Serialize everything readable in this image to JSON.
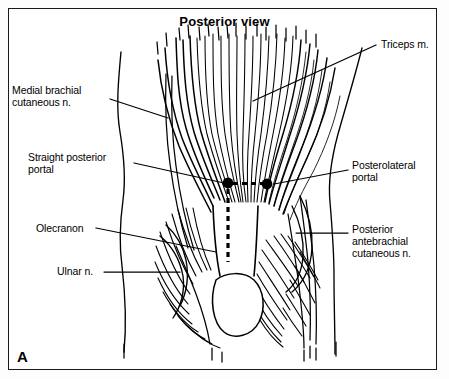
{
  "figure": {
    "title": "Posterior view",
    "panel_letter": "A",
    "frame_color": "#1a1a1a",
    "ink_color": "#000000",
    "background_color": "#ffffff"
  },
  "labels": {
    "medial_brachial_cutaneous": "Medial brachial\ncutaneous n.",
    "straight_posterior_portal": "Straight posterior\nportal",
    "olecranon": "Olecranon",
    "ulnar": "Ulnar n.",
    "triceps": "Triceps m.",
    "posterolateral_portal": "Posterolateral\nportal",
    "posterior_antebrachial_cutaneous": "Posterior\nantebrachial\ncutaneous n."
  },
  "portals": [
    {
      "name": "straight-posterior-portal",
      "x": 228,
      "y": 183,
      "radius": 5.4
    },
    {
      "name": "posterolateral-portal",
      "x": 267,
      "y": 184,
      "radius": 5.4
    }
  ]
}
